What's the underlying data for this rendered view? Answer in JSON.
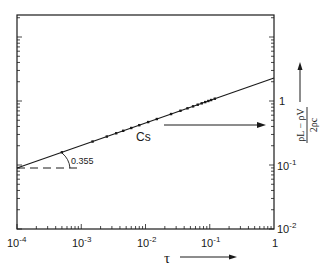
{
  "chart_data": {
    "type": "line",
    "title": "",
    "xlabel": "τ",
    "ylabel": "(ρL − ρV) / 2ρc",
    "xscale": "log",
    "yscale": "log",
    "xlim": [
      0.0001,
      1
    ],
    "ylim": [
      0.01,
      22
    ],
    "x_tick_labels": [
      "10^-4",
      "10^-3",
      "10^-2",
      "10^-1",
      "1"
    ],
    "y_tick_labels": [
      "10^-2",
      "10^-1",
      "1"
    ],
    "y_axis_side": "right",
    "grid": false,
    "series": [
      {
        "name": "Cs",
        "kind": "fit-line",
        "slope_label": "0.355",
        "x": [
          0.0001,
          1
        ],
        "y": [
          0.08,
          2.3
        ]
      },
      {
        "name": "Cs data",
        "kind": "points",
        "x": [
          0.0005,
          0.0015,
          0.0025,
          0.0035,
          0.0045,
          0.006,
          0.008,
          0.011,
          0.015,
          0.025,
          0.035,
          0.045,
          0.055,
          0.065,
          0.075,
          0.085,
          0.095,
          0.105,
          0.12
        ],
        "y": [
          0.16,
          0.24,
          0.29,
          0.33,
          0.36,
          0.4,
          0.44,
          0.49,
          0.59,
          0.66,
          0.74,
          0.8,
          0.86,
          0.9,
          0.94,
          0.98,
          1.02,
          1.05,
          1.1
        ]
      }
    ],
    "annotations": [
      {
        "text": "Cs",
        "type": "label-with-arrow-to-right-axis"
      },
      {
        "text": "0.355",
        "type": "slope-angle"
      }
    ]
  },
  "labels": {
    "x_ticks": [
      {
        "base": "10",
        "exp": "-4"
      },
      {
        "base": "10",
        "exp": "-3"
      },
      {
        "base": "10",
        "exp": "-2"
      },
      {
        "base": "10",
        "exp": "-1"
      },
      {
        "base": "1",
        "exp": ""
      }
    ],
    "y_ticks": [
      {
        "base": "1",
        "exp": ""
      },
      {
        "base": "10",
        "exp": "-1"
      },
      {
        "base": "10",
        "exp": "-2"
      }
    ],
    "x_axis_symbol": "τ",
    "series_label": "Cs",
    "slope_label": "0.355",
    "y_num": "ρL − ρV",
    "y_den": "2ρc"
  }
}
